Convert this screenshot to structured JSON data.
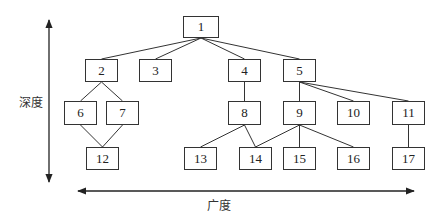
{
  "axes": {
    "vertical_label": "深度",
    "horizontal_label": "广度"
  },
  "nodes": [
    {
      "id": "1",
      "label": "1",
      "x": 183,
      "y": 16,
      "w": 36,
      "h": 22
    },
    {
      "id": "2",
      "label": "2",
      "x": 85,
      "y": 59,
      "w": 33,
      "h": 23
    },
    {
      "id": "3",
      "label": "3",
      "x": 139,
      "y": 59,
      "w": 33,
      "h": 23
    },
    {
      "id": "4",
      "label": "4",
      "x": 228,
      "y": 59,
      "w": 33,
      "h": 23
    },
    {
      "id": "5",
      "label": "5",
      "x": 283,
      "y": 59,
      "w": 33,
      "h": 23
    },
    {
      "id": "6",
      "label": "6",
      "x": 64,
      "y": 101,
      "w": 33,
      "h": 24
    },
    {
      "id": "7",
      "label": "7",
      "x": 106,
      "y": 101,
      "w": 33,
      "h": 24
    },
    {
      "id": "8",
      "label": "8",
      "x": 228,
      "y": 101,
      "w": 33,
      "h": 24
    },
    {
      "id": "9",
      "label": "9",
      "x": 283,
      "y": 101,
      "w": 33,
      "h": 24
    },
    {
      "id": "10",
      "label": "10",
      "x": 337,
      "y": 101,
      "w": 33,
      "h": 24
    },
    {
      "id": "11",
      "label": "11",
      "x": 392,
      "y": 101,
      "w": 33,
      "h": 24
    },
    {
      "id": "12",
      "label": "12",
      "x": 86,
      "y": 147,
      "w": 33,
      "h": 23
    },
    {
      "id": "13",
      "label": "13",
      "x": 184,
      "y": 147,
      "w": 33,
      "h": 23
    },
    {
      "id": "14",
      "label": "14",
      "x": 239,
      "y": 147,
      "w": 33,
      "h": 23
    },
    {
      "id": "15",
      "label": "15",
      "x": 283,
      "y": 147,
      "w": 33,
      "h": 23
    },
    {
      "id": "16",
      "label": "16",
      "x": 337,
      "y": 147,
      "w": 33,
      "h": 23
    },
    {
      "id": "17",
      "label": "17",
      "x": 392,
      "y": 147,
      "w": 33,
      "h": 23
    }
  ],
  "edges": [
    [
      "1",
      "2"
    ],
    [
      "1",
      "3"
    ],
    [
      "1",
      "4"
    ],
    [
      "1",
      "5"
    ],
    [
      "2",
      "6"
    ],
    [
      "2",
      "7"
    ],
    [
      "4",
      "8"
    ],
    [
      "5",
      "9"
    ],
    [
      "5",
      "10"
    ],
    [
      "5",
      "11"
    ],
    [
      "6",
      "12"
    ],
    [
      "7",
      "12"
    ],
    [
      "8",
      "13"
    ],
    [
      "8",
      "14"
    ],
    [
      "9",
      "14"
    ],
    [
      "9",
      "15"
    ],
    [
      "9",
      "16"
    ],
    [
      "11",
      "17"
    ]
  ]
}
